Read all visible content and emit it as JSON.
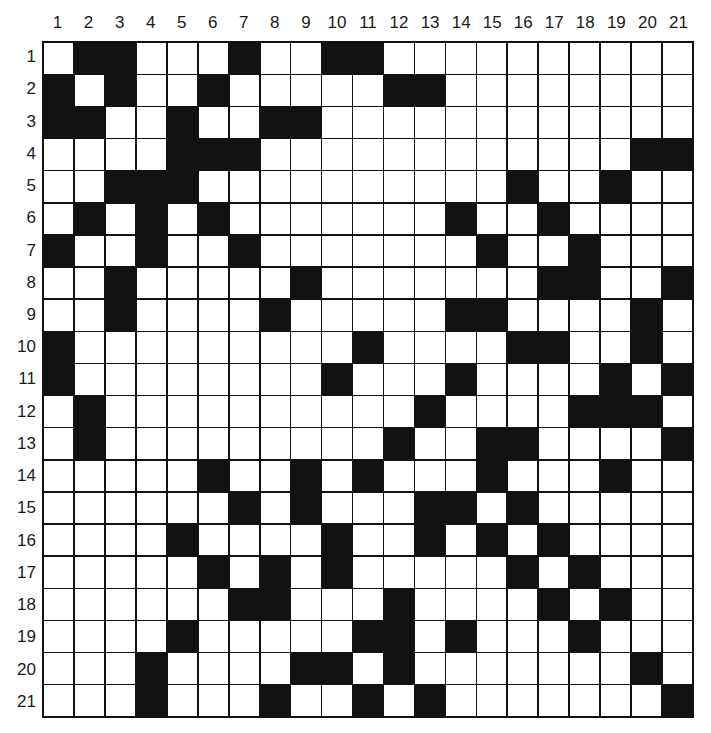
{
  "grid": {
    "rows": 21,
    "cols": 21,
    "column_labels": [
      "1",
      "2",
      "3",
      "4",
      "5",
      "6",
      "7",
      "8",
      "9",
      "10",
      "11",
      "12",
      "13",
      "14",
      "15",
      "16",
      "17",
      "18",
      "19",
      "20",
      "21"
    ],
    "row_labels": [
      "1",
      "2",
      "3",
      "4",
      "5",
      "6",
      "7",
      "8",
      "9",
      "10",
      "11",
      "12",
      "13",
      "14",
      "15",
      "16",
      "17",
      "18",
      "19",
      "20",
      "21"
    ],
    "colors": {
      "black": "#111111",
      "white": "#ffffff"
    },
    "black_cells_by_row": {
      "1": [
        2,
        3,
        7,
        10,
        11
      ],
      "2": [
        1,
        3,
        6,
        12,
        13
      ],
      "3": [
        1,
        2,
        5,
        8,
        9
      ],
      "4": [
        5,
        6,
        7,
        20,
        21
      ],
      "5": [
        3,
        4,
        5,
        16,
        19
      ],
      "6": [
        2,
        4,
        6,
        14,
        17
      ],
      "7": [
        1,
        4,
        7,
        15,
        18
      ],
      "8": [
        3,
        9,
        17,
        18,
        21
      ],
      "9": [
        3,
        8,
        14,
        15,
        20
      ],
      "10": [
        1,
        11,
        16,
        17,
        20
      ],
      "11": [
        1,
        10,
        14,
        19,
        21
      ],
      "12": [
        2,
        13,
        18,
        19,
        20
      ],
      "13": [
        2,
        12,
        15,
        16,
        21
      ],
      "14": [
        6,
        9,
        11,
        15,
        19
      ],
      "15": [
        7,
        9,
        13,
        14,
        16
      ],
      "16": [
        5,
        10,
        13,
        15,
        17
      ],
      "17": [
        6,
        8,
        10,
        16,
        18
      ],
      "18": [
        7,
        8,
        12,
        17,
        19
      ],
      "19": [
        5,
        11,
        12,
        14,
        18
      ],
      "20": [
        4,
        9,
        10,
        12,
        20
      ],
      "21": [
        4,
        8,
        11,
        13,
        21
      ]
    }
  }
}
